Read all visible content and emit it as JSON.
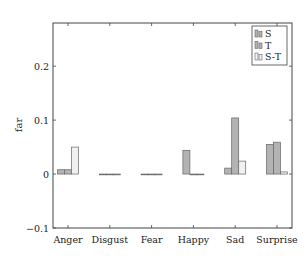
{
  "chart_data": {
    "type": "bar",
    "title": "",
    "xlabel": "",
    "ylabel": "far",
    "ylim": [
      -0.1,
      0.28
    ],
    "yticks": [
      -0.1,
      0,
      0.1,
      0.2
    ],
    "ytick_labels": [
      "−0.1",
      "0",
      "0.1",
      "0.2"
    ],
    "grid": false,
    "legend_position": "upper right",
    "categories": [
      "Anger",
      "Disgust",
      "Fear",
      "Happy",
      "Sad",
      "Surprise"
    ],
    "series": [
      {
        "name": "S",
        "color": "#b3b3b3",
        "values": [
          0.008,
          0.0,
          0.0,
          0.044,
          0.011,
          0.055
        ]
      },
      {
        "name": "T",
        "color": "#b3b3b3",
        "values": [
          0.008,
          0.0,
          0.0,
          0.0,
          0.104,
          0.059
        ]
      },
      {
        "name": "S-T",
        "color": "#f0f0f0",
        "values": [
          0.05,
          0.0,
          0.0,
          0.0,
          0.024,
          0.004
        ]
      }
    ]
  },
  "legend": {
    "items": [
      "S",
      "T",
      "S-T"
    ]
  },
  "axis": {
    "ylabel": "far"
  }
}
